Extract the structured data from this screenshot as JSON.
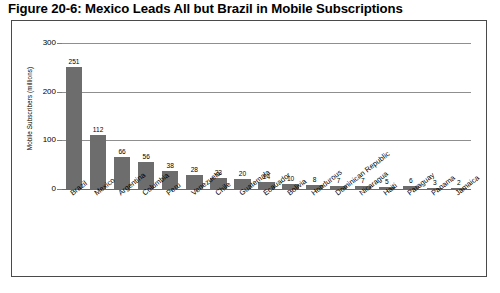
{
  "figure": {
    "title": "Figure 20-6:  Mexico Leads All but Brazil in Mobile Subscriptions"
  },
  "chart_data": {
    "type": "bar",
    "title": "Mexico Leads All but Brazil in Mobile Subscriptions",
    "xlabel": "",
    "ylabel": "Mobile Subscribers (millions)",
    "ylim": [
      0,
      300
    ],
    "yticks": [
      0,
      100,
      200,
      300
    ],
    "ytick_labels": [
      "0",
      "100",
      "200",
      "300"
    ],
    "grid": true,
    "legend": false,
    "bar_color": "#6d6d6d",
    "categories": [
      "Brazil",
      "Mexico",
      "Argentina",
      "Columbia",
      "Peru",
      "Venezuela",
      "Chile",
      "Guatemala",
      "Ecauador",
      "Bolivia",
      "Hondurous",
      "Dominican Republic",
      "Nicaragua",
      "Haiti",
      "Paraguay",
      "Panama",
      "Jamaica"
    ],
    "values": [
      251,
      112,
      66,
      56,
      38,
      28,
      23,
      20,
      14,
      10,
      8,
      7,
      7,
      5,
      6,
      3,
      2
    ],
    "data_labels": [
      "251",
      "112",
      "66",
      "56",
      "38",
      "28",
      "23",
      "20",
      "14",
      "10",
      "8",
      "7",
      "7",
      "5",
      "6",
      "3",
      "2"
    ]
  }
}
